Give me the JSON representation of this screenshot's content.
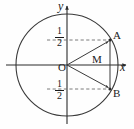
{
  "figure": {
    "kind": "unit-circle-geometry-diagram",
    "axes": {
      "y_axis_label": "y",
      "x_axis_label": "x",
      "origin_label": "O"
    },
    "points": [
      {
        "id": "A",
        "label": "A",
        "x_px": 110,
        "y_px": 40,
        "value_y": "1/2"
      },
      {
        "id": "B",
        "label": "B",
        "x_px": 110,
        "y_px": 89,
        "value_y": "-1/2"
      },
      {
        "id": "M",
        "label": "M",
        "x_px": 110,
        "y_px": 65,
        "value_y": "0"
      }
    ],
    "tick_labels": {
      "upper": {
        "numerator": "1",
        "denominator": "2"
      },
      "lower": {
        "numerator": "1",
        "denominator": "2"
      }
    },
    "colors": {
      "stroke": "#3a3a3a",
      "axis": "#2b2b2b",
      "dashed": "#6e6e6e",
      "text": "#1a1a1a",
      "background": "#fefefe"
    },
    "circle": {
      "center_px": [
        67,
        65
      ],
      "radius_px": 51
    },
    "segments": [
      {
        "from": "O",
        "to": "A",
        "style": "arrow"
      },
      {
        "from": "O",
        "to": "B",
        "style": "arrow"
      },
      {
        "from": "A",
        "to": "B",
        "style": "chord"
      }
    ],
    "dashed_guides": [
      {
        "from_px": [
          48,
          40
        ],
        "to_px": [
          110,
          40
        ]
      },
      {
        "from_px": [
          48,
          89
        ],
        "to_px": [
          110,
          89
        ]
      }
    ]
  }
}
